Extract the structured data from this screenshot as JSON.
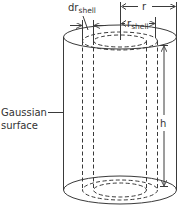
{
  "diagram": {
    "type": "gaussian-cylinder",
    "labels": {
      "gaussian_surface_line1": "Gaussian",
      "gaussian_surface_line2": "surface",
      "r": "r",
      "r_shell_main": "r",
      "r_shell_sub": "shell",
      "dr_shell_main": "dr",
      "dr_shell_sub": "shell",
      "h": "h"
    },
    "colors": {
      "stroke": "#3a3a3a",
      "text": "#333333",
      "background": "#ffffff"
    }
  }
}
